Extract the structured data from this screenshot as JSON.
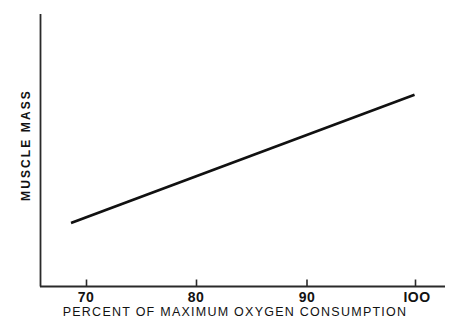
{
  "chart_data": {
    "type": "line",
    "title": "",
    "subtitle": "",
    "xlabel": "PERCENT OF MAXIMUM OXYGEN CONSUMPTION",
    "ylabel": "MUSCLE MASS",
    "xlim": [
      66.5,
      103.2
    ],
    "ylim": [
      0,
      1
    ],
    "grid": false,
    "legend": null,
    "x_ticks": [
      {
        "value": 70,
        "label": "70"
      },
      {
        "value": 80,
        "label": "80"
      },
      {
        "value": 90,
        "label": "90"
      },
      {
        "value": 100,
        "label": "IOO"
      }
    ],
    "y_ticks": [],
    "series": [
      {
        "name": "muscle mass",
        "x": [
          68.7,
          99.8
        ],
        "y": [
          0.235,
          0.702
        ],
        "color": "#111111",
        "linewidth": 2.6,
        "marker": "none"
      }
    ],
    "annotations": []
  },
  "axes": {
    "axis_color": "#2a2a2a",
    "axis_linewidth": 1.7,
    "tick_direction": "out-up",
    "tick_length": 7,
    "y_axis_top_value": 1.0,
    "y_axis_bottom_value": 0.0
  },
  "figure": {
    "background_color": "#ffffff",
    "ink_color": "#111111",
    "width": 466,
    "height": 332
  }
}
